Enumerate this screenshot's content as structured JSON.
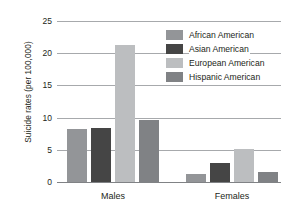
{
  "chart_data": {
    "type": "bar",
    "title": "",
    "xlabel": "",
    "ylabel": "Suicide rates (per 100,000)",
    "categories": [
      "Males",
      "Females"
    ],
    "series": [
      {
        "name": "African American",
        "color": "#939598",
        "values": [
          8.2,
          1.3
        ]
      },
      {
        "name": "Asian American",
        "color": "#454545",
        "values": [
          8.4,
          3.0
        ]
      },
      {
        "name": "European American",
        "color": "#bcbec0",
        "values": [
          21.2,
          5.2
        ]
      },
      {
        "name": "Hispanic American",
        "color": "#808285",
        "values": [
          9.6,
          1.5
        ]
      }
    ],
    "ylim": [
      0,
      25
    ],
    "yticks": [
      0,
      5,
      10,
      15,
      20,
      25
    ],
    "ytick_labels": [
      "0",
      "5",
      "10",
      "15",
      "20",
      "25"
    ],
    "grid": true,
    "legend_position": "upper right",
    "gridline_color": "#a7a9ac",
    "axis_color": "#808285",
    "text_color": "#231f20",
    "background": "#ffffff"
  }
}
